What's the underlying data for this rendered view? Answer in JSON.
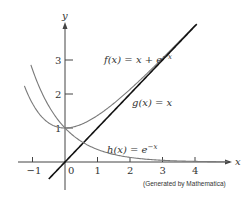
{
  "chart_data": {
    "type": "line",
    "title": "",
    "xlabel": "x",
    "ylabel": "y",
    "xlim": [
      -1.5,
      5
    ],
    "ylim": [
      -0.6,
      4
    ],
    "x_ticks": [
      -1,
      0,
      1,
      2,
      3,
      4
    ],
    "x_tick_labels": [
      "−1",
      "0",
      "1",
      "2",
      "3",
      "4"
    ],
    "y_ticks": [
      1,
      2,
      3
    ],
    "y_tick_labels": [
      "1",
      "2",
      "3"
    ],
    "grid": false,
    "legend": "inline annotations",
    "series": [
      {
        "name": "f(x) = x + e^(−x)",
        "label": "f(x) = x + e",
        "label_exp": "−x",
        "formula": "x + exp(-x)",
        "x_range": [
          -1.25,
          4.1
        ],
        "color": "#7a7a7a",
        "width": 1.1
      },
      {
        "name": "g(x) = x",
        "label": "g(x) = x",
        "formula": "x",
        "x_range": [
          -0.5,
          4.1
        ],
        "color": "#111111",
        "width": 1.6
      },
      {
        "name": "h(x) = e^(−x)",
        "label": "h(x) = e",
        "label_exp": "−x",
        "formula": "exp(-x)",
        "x_range": [
          -1.05,
          5.0
        ],
        "color": "#7a7a7a",
        "width": 1.1
      }
    ],
    "sample_points": {
      "f": [
        [
          -1,
          1.72
        ],
        [
          0,
          1.0
        ],
        [
          1,
          1.37
        ],
        [
          2,
          2.14
        ],
        [
          3,
          3.05
        ],
        [
          4,
          4.02
        ]
      ],
      "g": [
        [
          -0.5,
          -0.5
        ],
        [
          0,
          0
        ],
        [
          1,
          1
        ],
        [
          2,
          2
        ],
        [
          3,
          3
        ],
        [
          4,
          4
        ]
      ],
      "h": [
        [
          -1,
          2.72
        ],
        [
          0,
          1.0
        ],
        [
          1,
          0.37
        ],
        [
          2,
          0.14
        ],
        [
          3,
          0.05
        ],
        [
          4,
          0.02
        ]
      ]
    }
  },
  "annotation": "(Generated by Mathematica)",
  "layout": {
    "origin_px": [
      65,
      162
    ],
    "px_per_x": 32.5,
    "px_per_y": 34
  }
}
